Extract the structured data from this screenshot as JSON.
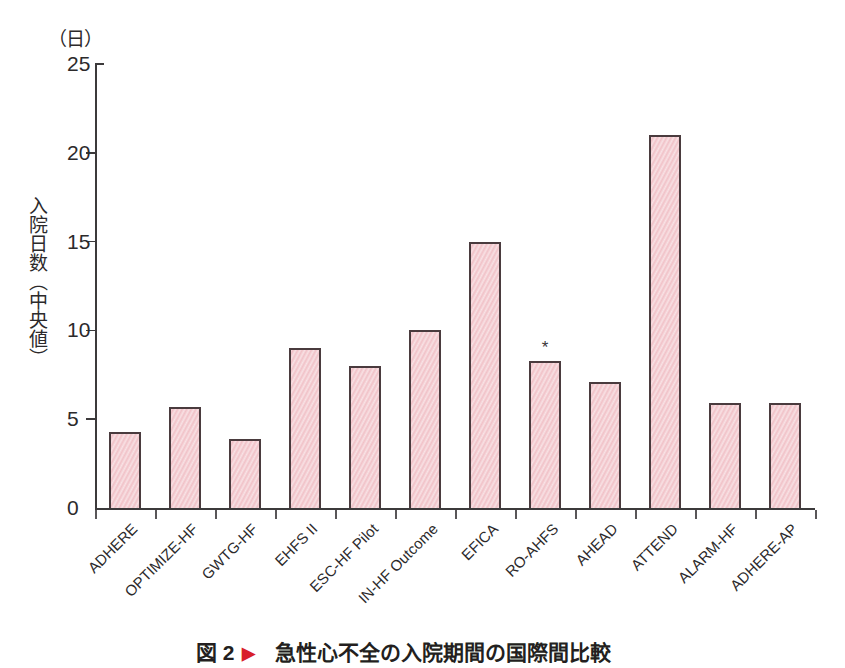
{
  "chart_data": {
    "type": "bar",
    "title": "急性心不全の入院期間の国際間比較",
    "figure_number": "図 2",
    "figure_marker": "▶",
    "unit_label": "（日）",
    "ylabel": "入院日数（中央値）",
    "xlabel": "",
    "ylim": [
      0,
      25
    ],
    "yticks": [
      0,
      5,
      10,
      15,
      20,
      25
    ],
    "ytick_labels": [
      "0",
      "5",
      "10",
      "15",
      "20",
      "25"
    ],
    "grid": false,
    "legend": null,
    "categories": [
      "ADHERE",
      "OPTIMIZE-HF",
      "GWTG-HF",
      "EHFS II",
      "ESC-HF Pilot",
      "IN-HF Outcome",
      "EFICA",
      "RO-AHFS",
      "AHEAD",
      "ATTEND",
      "ALARM-HF",
      "ADHERE-AP"
    ],
    "values": [
      4.3,
      5.7,
      3.9,
      9.0,
      8.0,
      10.0,
      15.0,
      8.3,
      7.1,
      21.0,
      5.9,
      5.9
    ],
    "annotations": [
      {
        "category": "RO-AHFS",
        "text": "*"
      }
    ],
    "bar_color": "#f1c2c8",
    "bar_edge_color": "#4a3b3e"
  }
}
